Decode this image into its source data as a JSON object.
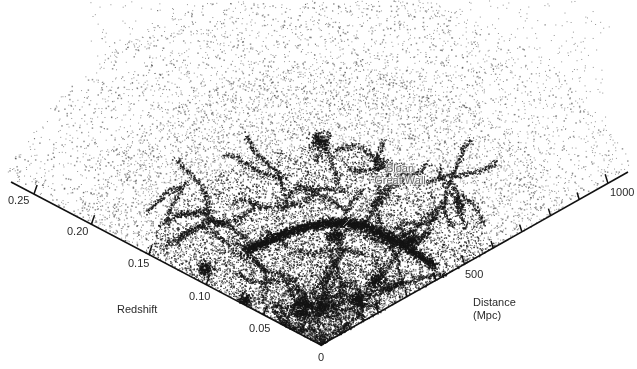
{
  "chart_data": {
    "type": "scatter",
    "subtype": "wedge-diagram",
    "title": "",
    "colors": {
      "points": "#1a1a1a",
      "axis": "#111111",
      "annotation": "#6b6b6b"
    },
    "axes": {
      "left": {
        "label": "Redshift",
        "ticks": [
          "0.05",
          "0.10",
          "0.15",
          "0.20",
          "0.25"
        ],
        "range": [
          0,
          0.27
        ]
      },
      "right": {
        "label_line1": "Distance",
        "label_line2": "(Mpc)",
        "ticks_labeled": [
          "500",
          "1000"
        ],
        "minor_tick_step": 100,
        "range": [
          0,
          1070
        ]
      },
      "origin_label": "0"
    },
    "annotations": [
      {
        "line1": "Sloan",
        "line2": "Great Wall"
      }
    ],
    "density_features": [
      {
        "name": "Sloan Great Wall arc",
        "approx_redshift": 0.08,
        "density": "high"
      },
      {
        "name": "filament web",
        "approx_redshift_range": [
          0,
          0.12
        ],
        "density": "high"
      },
      {
        "name": "sparse outer field",
        "approx_redshift_range": [
          0.15,
          0.27
        ],
        "density": "low"
      }
    ],
    "grid": false,
    "legend": null
  }
}
